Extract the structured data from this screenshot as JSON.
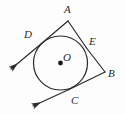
{
  "figure": {
    "kind": "geometry-diagram",
    "width": 125,
    "height": 114,
    "background_color": "#fdfdfd",
    "stroke_color": "#2b2b2b",
    "label_color": "#2b2b2b",
    "circle": {
      "center_label": "O",
      "center_x": 60.5,
      "center_y": 63,
      "radius": 27,
      "center_dot_radius": 2.4,
      "stroke_width": 1.2
    },
    "vertices": [
      {
        "label": "A",
        "x": 68,
        "y": 21,
        "label_x": 64,
        "label_y": 4
      },
      {
        "label": "B",
        "x": 105,
        "y": 72,
        "label_x": 108,
        "label_y": 68
      }
    ],
    "tangent_points": [
      {
        "label": "D",
        "x": 41.5,
        "y": 43.5,
        "label_x": 24,
        "label_y": 29
      },
      {
        "label": "E",
        "x": 86.5,
        "y": 48,
        "label_x": 89,
        "label_y": 36
      },
      {
        "label": "C",
        "x": 69,
        "y": 89.5,
        "label_x": 71,
        "label_y": 95
      }
    ],
    "segments": [
      {
        "name": "segment-D-A",
        "x1": 41.5,
        "y1": 43.5,
        "x2": 68,
        "y2": 21
      },
      {
        "name": "segment-A-E",
        "x1": 68,
        "y1": 21,
        "x2": 86.5,
        "y2": 48
      },
      {
        "name": "segment-E-B",
        "x1": 86.5,
        "y1": 48,
        "x2": 105,
        "y2": 72
      },
      {
        "name": "segment-B-C",
        "x1": 105,
        "y1": 72,
        "x2": 69,
        "y2": 89.5
      }
    ],
    "rays": [
      {
        "name": "ray-D-arrow",
        "x1": 41.5,
        "y1": 43.5,
        "x2": 11,
        "y2": 69,
        "arrow": "filled"
      },
      {
        "name": "ray-C-arrow",
        "x1": 69,
        "y1": 89.5,
        "x2": 33,
        "y2": 106,
        "arrow": "filled"
      }
    ],
    "labels": {
      "A": "A",
      "B": "B",
      "C": "C",
      "D": "D",
      "E": "E",
      "O": "O"
    }
  }
}
